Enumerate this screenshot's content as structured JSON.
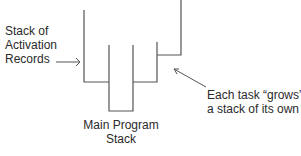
{
  "diagram": {
    "type": "stack-diagram",
    "labels": {
      "activation_records": [
        "Stack of",
        "Activation",
        "Records"
      ],
      "main_stack": [
        "Main Program",
        "Stack"
      ],
      "task_note": [
        "Each task “grows”",
        "a stack of its own"
      ]
    },
    "colors": {
      "line": "#555555",
      "text": "#2a2a2a",
      "background": "#ffffff"
    }
  }
}
